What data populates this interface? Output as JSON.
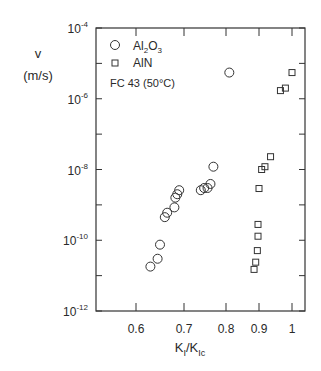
{
  "chart_data": {
    "type": "scatter",
    "title": "",
    "xlabel": "K_I/K_Ic",
    "ylabel": "v (m/s)",
    "yscale": "log",
    "ylim": [
      1e-12,
      0.0001
    ],
    "xlim": [
      0.5,
      1.03
    ],
    "grid": false,
    "legend_position": "upper left",
    "annotation": "FC 43 (50°C)",
    "x_ticks": [
      "0.6",
      "0.7",
      "0.8",
      "0.9",
      "1"
    ],
    "y_ticks": [
      "10^-12",
      "10^-10",
      "10^-8",
      "10^-6",
      "10^-4"
    ],
    "series": [
      {
        "name": "Al2O3",
        "marker": "circle",
        "points": [
          {
            "x": 0.63,
            "y": 1.8e-11
          },
          {
            "x": 0.645,
            "y": 3e-11
          },
          {
            "x": 0.65,
            "y": 7.5e-11
          },
          {
            "x": 0.66,
            "y": 4.5e-10
          },
          {
            "x": 0.665,
            "y": 6e-10
          },
          {
            "x": 0.68,
            "y": 8.5e-10
          },
          {
            "x": 0.682,
            "y": 1.6e-09
          },
          {
            "x": 0.686,
            "y": 2e-09
          },
          {
            "x": 0.69,
            "y": 2.6e-09
          },
          {
            "x": 0.74,
            "y": 2.6e-09
          },
          {
            "x": 0.748,
            "y": 3e-09
          },
          {
            "x": 0.756,
            "y": 3e-09
          },
          {
            "x": 0.763,
            "y": 3.9e-09
          },
          {
            "x": 0.77,
            "y": 1.2e-08
          },
          {
            "x": 0.81,
            "y": 5.5e-06
          }
        ]
      },
      {
        "name": "AlN",
        "marker": "square",
        "points": [
          {
            "x": 0.885,
            "y": 1.5e-11
          },
          {
            "x": 0.89,
            "y": 2.4e-11
          },
          {
            "x": 0.895,
            "y": 5.1e-11
          },
          {
            "x": 0.897,
            "y": 1.3e-10
          },
          {
            "x": 0.897,
            "y": 2.8e-10
          },
          {
            "x": 0.9,
            "y": 2.9e-09
          },
          {
            "x": 0.908,
            "y": 1e-08
          },
          {
            "x": 0.918,
            "y": 1.2e-08
          },
          {
            "x": 0.935,
            "y": 2.3e-08
          },
          {
            "x": 0.965,
            "y": 1.7e-06
          },
          {
            "x": 0.98,
            "y": 2e-06
          },
          {
            "x": 1.0,
            "y": 5.5e-06
          }
        ]
      }
    ]
  },
  "labels": {
    "y_axis_var": "v",
    "y_axis_unit": "(m/s)",
    "x_axis_main": "K",
    "x_axis_sub1": "I",
    "x_axis_slash": "/K",
    "x_axis_sub2": "Ic",
    "legend": [
      {
        "symbol": "circle",
        "text_main": "Al",
        "sub1": "2",
        "mid": "O",
        "sub2": "3"
      },
      {
        "symbol": "square",
        "text_main": "AlN"
      }
    ],
    "annotation": "FC 43 (50°C)"
  }
}
